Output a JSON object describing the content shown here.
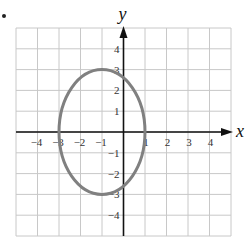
{
  "chart_data": {
    "type": "line",
    "title": "",
    "xlabel": "x",
    "ylabel": "y",
    "xlim": [
      -5,
      5
    ],
    "ylim": [
      -5,
      5
    ],
    "grid": true,
    "x_ticks": [
      -4,
      -3,
      -2,
      -1,
      1,
      2,
      3,
      4
    ],
    "y_ticks": [
      4,
      3,
      2,
      1,
      -1,
      -2,
      -3,
      -4
    ],
    "x_tick_labels": [
      "−4",
      "−3",
      "−2",
      "−1",
      "1",
      "2",
      "3",
      "4"
    ],
    "y_tick_labels": [
      "4",
      "3",
      "2",
      "1",
      "−1",
      "−2",
      "−3",
      "−4"
    ],
    "series": [
      {
        "name": "ellipse",
        "shape": "ellipse",
        "center": [
          -1,
          0
        ],
        "semi_axis_x": 2,
        "semi_axis_y": 3,
        "equation": "(x+1)^2/4 + y^2/9 = 1",
        "points": [
          [
            -3,
            0
          ],
          [
            1,
            0
          ],
          [
            -1,
            3
          ],
          [
            -1,
            -3
          ]
        ],
        "color": "#808080"
      }
    ]
  },
  "colors": {
    "grid": "#c8c8c8",
    "axis": "#111111",
    "curve": "#808080"
  }
}
